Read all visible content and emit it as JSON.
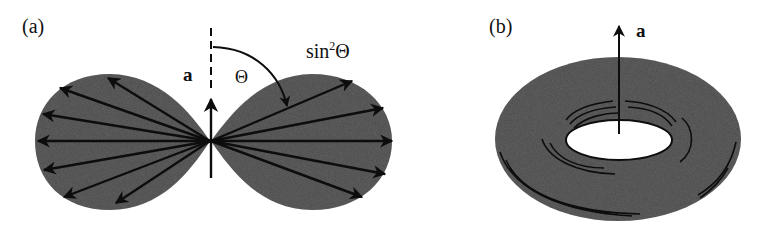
{
  "panels": [
    {
      "id": "a",
      "label": "(a)",
      "vector_label": "a",
      "angle_label": "Θ",
      "function_label_prefix": "sin",
      "function_label_power": "2",
      "function_label_suffix": "Θ",
      "description": "Dipole radiation pattern cross-section with radial arrows showing sin²Θ intensity"
    },
    {
      "id": "b",
      "label": "(b)",
      "vector_label": "a",
      "description": "3D torus (doughnut) radiation pattern around acceleration vector a"
    }
  ],
  "colors": {
    "fill": "#4a4a4a",
    "ink": "#0d0d0d",
    "background": "#ffffff",
    "hole": "#ffffff"
  }
}
